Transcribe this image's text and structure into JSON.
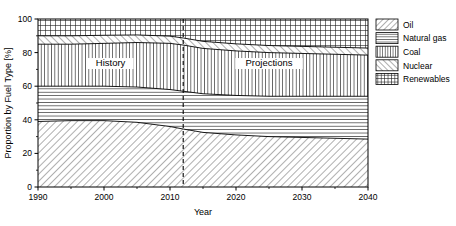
{
  "chart_data": {
    "type": "area",
    "title": "",
    "xlabel": "Year",
    "ylabel": "Proportion by Fuel Type [%]",
    "xlim": [
      1990,
      2040
    ],
    "ylim": [
      0,
      100
    ],
    "xticks": [
      1990,
      2000,
      2010,
      2020,
      2030,
      2040
    ],
    "yticks": [
      0,
      20,
      40,
      60,
      80,
      100
    ],
    "grid": false,
    "stacked": true,
    "legend_position": "right",
    "x": [
      1990,
      1995,
      2000,
      2005,
      2010,
      2012,
      2015,
      2020,
      2025,
      2030,
      2035,
      2040
    ],
    "series": [
      {
        "name": "Oil",
        "pattern": "diagonal-up-hatch",
        "values": [
          39,
          39.5,
          39.5,
          38.5,
          36,
          34.5,
          32.5,
          31,
          30,
          29.5,
          29,
          28.5
        ]
      },
      {
        "name": "Natural gas",
        "pattern": "horizontal-lines",
        "values": [
          21,
          20.5,
          20.5,
          21,
          22,
          22.5,
          23,
          23.5,
          24,
          24.5,
          25,
          25.5
        ]
      },
      {
        "name": "Coal",
        "pattern": "vertical-lines",
        "values": [
          25,
          25,
          25.5,
          26.5,
          27.5,
          27.5,
          27,
          26.5,
          26,
          25.5,
          25,
          24.5
        ]
      },
      {
        "name": "Nuclear",
        "pattern": "diagonal-down-hatch",
        "values": [
          5,
          5,
          4.8,
          4.5,
          4.3,
          4.2,
          4.2,
          4.2,
          4.2,
          4.2,
          4.2,
          4.2
        ]
      },
      {
        "name": "Renewables",
        "pattern": "cross-hatch",
        "values": [
          10,
          10,
          9.7,
          9.5,
          10.2,
          11.3,
          13.3,
          14.8,
          15.8,
          16.3,
          16.8,
          17.3
        ]
      }
    ],
    "cumulative_top_boundaries": {
      "oil": [
        39,
        39.5,
        39.5,
        38.5,
        36,
        34.5,
        32.5,
        31,
        30,
        29.5,
        29,
        28.5
      ],
      "natural_gas": [
        60,
        60,
        60,
        59.5,
        58,
        57,
        55.5,
        54.5,
        54,
        54,
        54,
        54
      ],
      "coal": [
        85,
        85,
        85.5,
        86,
        85.5,
        84.5,
        82.5,
        81,
        80,
        79.5,
        79,
        78.5
      ],
      "nuclear": [
        90,
        90,
        90.3,
        90.5,
        89.8,
        88.7,
        86.7,
        85.2,
        84.2,
        83.7,
        83.2,
        82.7
      ],
      "renewables": [
        100,
        100,
        100,
        100,
        100,
        100,
        100,
        100,
        100,
        100,
        100,
        100
      ]
    },
    "annotations": [
      {
        "text": "History",
        "x": 2001,
        "y": 72
      },
      {
        "text": "Projections",
        "x": 2025,
        "y": 72
      }
    ],
    "divider": {
      "x": 2012,
      "style": "dashed"
    }
  },
  "axes": {
    "y_title": "Proportion by Fuel Type [%]",
    "x_title": "Year",
    "y_tick_labels": [
      "0",
      "20",
      "40",
      "60",
      "80",
      "100"
    ],
    "x_tick_labels": [
      "1990",
      "2000",
      "2010",
      "2020",
      "2030",
      "2040"
    ]
  },
  "legend": {
    "items": [
      {
        "label": "Oil",
        "pattern": "diagonal-up-hatch"
      },
      {
        "label": "Natural gas",
        "pattern": "horizontal-lines"
      },
      {
        "label": "Coal",
        "pattern": "vertical-lines"
      },
      {
        "label": "Nuclear",
        "pattern": "diagonal-down-hatch"
      },
      {
        "label": "Renewables",
        "pattern": "cross-hatch"
      }
    ]
  },
  "era_labels": {
    "history": "History",
    "projections": "Projections"
  },
  "colors": {
    "line": "#000000",
    "background": "#ffffff",
    "hatch": "#1a1a1a"
  }
}
